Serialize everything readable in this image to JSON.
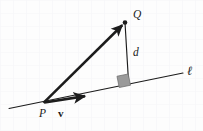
{
  "figure": {
    "kind": "geometry-diagram",
    "width": 203,
    "height": 131,
    "background_color": "#fdfdfd",
    "grid": {
      "visible": true,
      "spacing": 13,
      "color": "#f5f5f7"
    },
    "ink_color": "#1c1c1c",
    "right_angle_fill": "#9a9a9a",
    "right_angle_stroke": "#6d6d6d"
  },
  "labels": {
    "point_p": "P",
    "point_q": "Q",
    "vector_v": "v",
    "distance_d": "d",
    "line_l": "ℓ"
  },
  "geometry": {
    "line_l": {
      "x1": 9,
      "y1": 108.5,
      "x2": 183,
      "y2": 73.0
    },
    "point_p": {
      "x": 43.5,
      "y": 102.8
    },
    "point_q": {
      "x": 125.0,
      "y": 22.5
    },
    "foot_of_perpendicular": {
      "x": 128.5,
      "y": 81.5
    },
    "vector_v_tip": {
      "x": 89.0,
      "y": 95.5
    },
    "right_angle_square": {
      "x": 118.0,
      "y": 75.0,
      "size": 11.5,
      "rotation_deg": -11.5
    }
  },
  "label_positions": {
    "point_p": {
      "x": 39.0,
      "y": 117.0
    },
    "point_q": {
      "x": 133.0,
      "y": 18.0
    },
    "vector_v": {
      "x": 58.0,
      "y": 117.0
    },
    "distance_d": {
      "x": 133.0,
      "y": 56.0
    },
    "line_l": {
      "x": 187.0,
      "y": 75.0
    }
  }
}
